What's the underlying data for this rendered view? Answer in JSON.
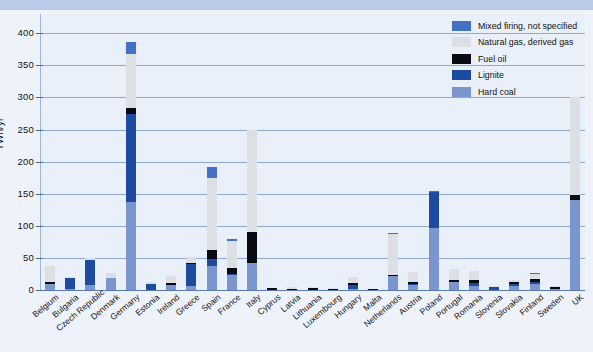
{
  "chart_data": {
    "type": "bar",
    "title": "",
    "subtitle": "",
    "xlabel": "",
    "ylabel": "TWh/yr",
    "ylim": [
      0,
      430
    ],
    "yticks": [
      0,
      50,
      100,
      150,
      200,
      250,
      300,
      350,
      400
    ],
    "grid": true,
    "stacked": true,
    "legend_position": "top-right",
    "categories": [
      "Belgium",
      "Bulgaria",
      "Czech Republic",
      "Denmark",
      "Germany",
      "Estonia",
      "Ireland",
      "Greece",
      "Spain",
      "France",
      "Italy",
      "Cyprus",
      "Latvia",
      "Lithuania",
      "Luxembourg",
      "Hungary",
      "Malta",
      "Netherlands",
      "Austria",
      "Poland",
      "Portugal",
      "Romania",
      "Slovenia",
      "Slovakia",
      "Finland",
      "Sweden",
      "UK"
    ],
    "series": [
      {
        "name": "Hard coal",
        "color": "#7b96cf",
        "values": [
          10,
          2,
          8,
          18,
          137,
          0,
          8,
          6,
          38,
          23,
          42,
          0,
          0,
          0,
          0,
          2,
          0,
          22,
          8,
          97,
          12,
          6,
          0,
          6,
          10,
          2,
          140
        ]
      },
      {
        "name": "Lignite",
        "color": "#1d4ba0",
        "values": [
          0,
          16,
          38,
          0,
          138,
          9,
          0,
          34,
          11,
          2,
          0,
          0,
          0,
          0,
          0,
          6,
          0,
          0,
          2,
          55,
          0,
          5,
          4,
          4,
          3,
          0,
          0
        ]
      },
      {
        "name": "Fuel oil",
        "color": "#0a0a14",
        "values": [
          2,
          0,
          1,
          0,
          8,
          1,
          3,
          2,
          13,
          10,
          48,
          3,
          2,
          3,
          1,
          3,
          2,
          1,
          2,
          0,
          4,
          4,
          1,
          2,
          4,
          2,
          8
        ]
      },
      {
        "name": "Natural gas, derived gas",
        "color": "#dcdfe4",
        "values": [
          25,
          3,
          3,
          9,
          85,
          2,
          11,
          10,
          112,
          42,
          160,
          0,
          2,
          1,
          2,
          9,
          0,
          64,
          16,
          0,
          16,
          14,
          2,
          4,
          8,
          2,
          152
        ]
      },
      {
        "name": "Mixed firing, not specified",
        "color": "#4571c4",
        "values": [
          0,
          0,
          0,
          0,
          18,
          0,
          0,
          0,
          18,
          1,
          0,
          0,
          0,
          0,
          0,
          0,
          0,
          1,
          0,
          3,
          0,
          0,
          0,
          0,
          2,
          0,
          0
        ]
      }
    ],
    "legend_entries": [
      "Mixed firing, not specified",
      "Natural gas, derived gas",
      "Fuel oil",
      "Lignite",
      "Hard coal"
    ]
  },
  "colors": {
    "background": "#eef3fb",
    "top_band": "#b9cbe8",
    "plot_background": "#e9f0fa",
    "grid": "#8fa9d4",
    "axis": "#5a79b5",
    "text": "#111111"
  }
}
